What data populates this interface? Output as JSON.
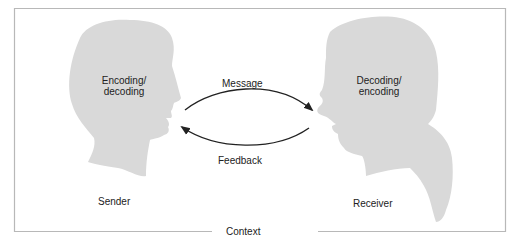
{
  "diagram": {
    "type": "communication-model",
    "frame_label": "Context",
    "sender": {
      "role_label": "Sender",
      "process_line1": "Encoding/",
      "process_line2": "decoding"
    },
    "receiver": {
      "role_label": "Receiver",
      "process_line1": "Decoding/",
      "process_line2": "encoding"
    },
    "arrows": {
      "top": {
        "label": "Message",
        "direction": "sender-to-receiver"
      },
      "bottom": {
        "label": "Feedback",
        "direction": "receiver-to-sender"
      }
    },
    "colors": {
      "head_fill": "#d9d9d9",
      "frame": "#b0b0b0",
      "arrow": "#222222",
      "text": "#222222"
    }
  }
}
